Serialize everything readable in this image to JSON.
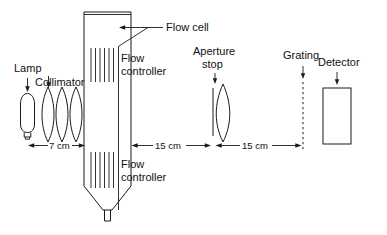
{
  "figure": {
    "background_color": "#ffffff",
    "line_color": "#1a1a1a"
  },
  "labels": {
    "lamp": "Lamp",
    "collimator": "Collimator",
    "flow_cell": "Flow cell",
    "flow_controller_top": "Flow\ncontroller",
    "flow_controller_top_line1": "Flow",
    "flow_controller_top_line2": "controller",
    "flow_controller_bottom_line1": "Flow",
    "flow_controller_bottom_line2": "controller",
    "aperture_stop_line1": "Aperture",
    "aperture_stop_line2": "stop",
    "grating": "Grating",
    "detector": "Detector"
  },
  "dimensions": [
    {
      "name": "lamp-to-cell",
      "text": "7 cm",
      "value": 7,
      "unit": "cm"
    },
    {
      "name": "cell-to-aperture",
      "text": "15 cm",
      "value": 15,
      "unit": "cm"
    },
    {
      "name": "aperture-to-grating",
      "text": "15 cm",
      "value": 15,
      "unit": "cm"
    }
  ],
  "components": [
    {
      "name": "lamp",
      "shape": "bulb",
      "label": "Lamp"
    },
    {
      "name": "collimator",
      "shape": "three-biconvex-lenses",
      "label": "Collimator",
      "lens_count": 3
    },
    {
      "name": "flow-cell",
      "shape": "column-with-funnel",
      "label": "Flow cell",
      "hatch_bands": 2,
      "hatch_lines_per_band": 6
    },
    {
      "name": "aperture-stop",
      "shape": "slit-and-lens",
      "label": "Aperture stop"
    },
    {
      "name": "grating",
      "shape": "dashed-vertical-line",
      "label": "Grating"
    },
    {
      "name": "detector",
      "shape": "rectangle",
      "label": "Detector"
    }
  ]
}
